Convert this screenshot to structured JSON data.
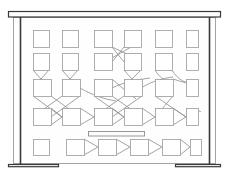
{
  "scene": {
    "title": "Whiteboard diagram sketch",
    "type": "line-drawing",
    "canvas": {
      "width": 229,
      "height": 180
    },
    "background_color": "#ffffff",
    "ink_color": "#3a3a3a",
    "node_stroke_color": "#a0a0a0",
    "link_stroke_color": "#8c8c8c"
  },
  "frame": {
    "name": "board-frame",
    "outer": {
      "x": 13,
      "y": 17,
      "width": 203,
      "height": 147
    },
    "label": "Board outline"
  },
  "top_rail": {
    "name": "top-rail",
    "x": 8,
    "y": 11,
    "width": 213,
    "height": 6,
    "label": "Top rail"
  },
  "bottom_rail": {
    "name": "bottom-rail",
    "left": {
      "x": 8,
      "y": 164,
      "width": 50,
      "height": 3
    },
    "right": {
      "x": 175,
      "y": 164,
      "width": 46,
      "height": 3
    },
    "label": "Bottom rail"
  },
  "posts": {
    "name": "side-posts",
    "left_x": 20,
    "right_x": 209,
    "top_y": 17,
    "bottom_y": 165,
    "label": "Side posts"
  },
  "marker_tray": {
    "name": "marker-tray",
    "x": 88,
    "y": 131,
    "width": 57,
    "height": 5,
    "label": "Marker tray"
  },
  "diagram": {
    "label": "Node grid",
    "rows": [
      {
        "row_id": "row-1",
        "y": 30,
        "box_h": 17,
        "boxes": [
          {
            "x": 33,
            "w": 16
          },
          {
            "x": 62,
            "w": 16
          },
          {
            "x": 94,
            "w": 18
          },
          {
            "x": 124,
            "w": 17
          },
          {
            "x": 155,
            "w": 17
          },
          {
            "x": 186,
            "w": 12
          }
        ]
      },
      {
        "row_id": "row-2",
        "y": 53,
        "box_h": 17,
        "boxes": [
          {
            "x": 33,
            "w": 16
          },
          {
            "x": 62,
            "w": 16
          },
          {
            "x": 94,
            "w": 18
          },
          {
            "x": 124,
            "w": 17
          },
          {
            "x": 155,
            "w": 17
          },
          {
            "x": 186,
            "w": 12
          }
        ]
      },
      {
        "row_id": "row-3",
        "y": 79,
        "box_h": 17,
        "boxes": [
          {
            "x": 33,
            "w": 18
          },
          {
            "x": 62,
            "w": 18
          },
          {
            "x": 94,
            "w": 18
          },
          {
            "x": 124,
            "w": 18
          },
          {
            "x": 155,
            "w": 18
          },
          {
            "x": 186,
            "w": 12
          }
        ]
      },
      {
        "row_id": "row-4",
        "y": 108,
        "box_h": 17,
        "boxes": [
          {
            "x": 33,
            "w": 18
          },
          {
            "x": 62,
            "w": 18
          },
          {
            "x": 94,
            "w": 18
          },
          {
            "x": 124,
            "w": 18
          },
          {
            "x": 155,
            "w": 18
          },
          {
            "x": 186,
            "w": 12
          }
        ]
      },
      {
        "row_id": "row-5",
        "y": 139,
        "box_h": 16,
        "boxes": [
          {
            "x": 33,
            "w": 16
          },
          {
            "x": 66,
            "w": 18
          },
          {
            "x": 98,
            "w": 18
          },
          {
            "x": 130,
            "w": 18
          },
          {
            "x": 162,
            "w": 18
          },
          {
            "x": 190,
            "w": 11
          }
        ]
      }
    ],
    "link_count": 34,
    "link_style": "thin curved and straight crossings"
  }
}
